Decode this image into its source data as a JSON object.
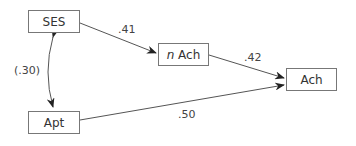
{
  "nodes": {
    "ses": {
      "label": "SES"
    },
    "apt": {
      "label": "Apt"
    },
    "nach": {
      "prefix": "n",
      "label": " Ach"
    },
    "ach": {
      "label": "Ach"
    }
  },
  "edges": {
    "ses_nach": {
      "coef": ".41"
    },
    "nach_ach": {
      "coef": ".42"
    },
    "apt_ach": {
      "coef": ".50"
    },
    "ses_apt": {
      "coef": "(.30)"
    }
  }
}
